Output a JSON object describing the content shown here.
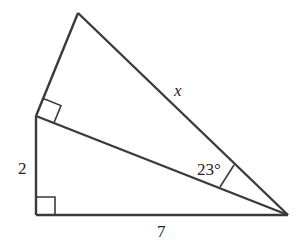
{
  "diagram": {
    "type": "geometry",
    "stroke_color": "#3a3a3a",
    "vertices": {
      "apex": [
        78,
        13
      ],
      "middle_left": [
        36,
        116
      ],
      "bottom_left": [
        36,
        215
      ],
      "right": [
        288,
        215
      ]
    },
    "labels": {
      "hypotenuse_top": "x",
      "left_leg": "2",
      "bottom_leg": "7",
      "angle": "23°"
    },
    "right_angles": [
      "middle_left",
      "bottom_left"
    ],
    "angle_marker_vertex": "right"
  }
}
